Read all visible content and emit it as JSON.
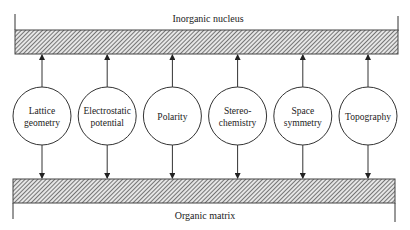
{
  "diagram": {
    "top_bar_label": "Inorganic nucleus",
    "bottom_bar_label": "Organic matrix",
    "nodes": [
      {
        "lines": [
          "Lattice",
          "geometry"
        ]
      },
      {
        "lines": [
          "Electrostatic",
          "potential"
        ]
      },
      {
        "lines": [
          "Polarity"
        ]
      },
      {
        "lines": [
          "Stereo-",
          "chemistry"
        ]
      },
      {
        "lines": [
          "Space",
          "symmetry"
        ]
      },
      {
        "lines": [
          "Topography"
        ]
      }
    ],
    "arrow_direction": "from node up to inorganic nucleus; from node down to organic matrix"
  }
}
